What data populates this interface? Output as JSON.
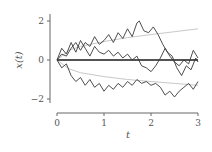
{
  "chart_data": {
    "type": "line",
    "title": "",
    "xlabel": "t",
    "ylabel": "x(t)",
    "xlim": [
      0,
      3
    ],
    "ylim": [
      -2.5,
      2.5
    ],
    "xticks": [
      0,
      1,
      2,
      3
    ],
    "xtick_labels": [
      "0",
      "1",
      "2",
      "3"
    ],
    "yticks": [
      -2,
      0,
      2
    ],
    "ytick_labels": [
      "−2",
      "0",
      "2"
    ],
    "grid": false,
    "legend": null,
    "series": [
      {
        "name": "mean",
        "style": "thick black",
        "x": [
          0,
          3
        ],
        "values": [
          0,
          0
        ]
      },
      {
        "name": "upper envelope",
        "style": "light gray smooth",
        "x": [
          0,
          0.25,
          0.5,
          1,
          1.5,
          2,
          2.5,
          3
        ],
        "values": [
          0,
          0.5,
          0.7,
          0.95,
          1.15,
          1.3,
          1.45,
          1.6
        ]
      },
      {
        "name": "lower envelope",
        "style": "light gray smooth",
        "x": [
          0,
          0.25,
          0.5,
          1,
          1.5,
          2,
          2.5,
          3
        ],
        "values": [
          0,
          -0.45,
          -0.65,
          -0.85,
          -1.0,
          -1.1,
          -1.2,
          -1.3
        ]
      },
      {
        "name": "path 1",
        "style": "dark gray jagged",
        "x": [
          0,
          0.1,
          0.2,
          0.3,
          0.4,
          0.5,
          0.6,
          0.7,
          0.8,
          0.9,
          1.0,
          1.1,
          1.2,
          1.3,
          1.4,
          1.5,
          1.6,
          1.7,
          1.75,
          1.85,
          1.95,
          2.05,
          2.15,
          2.25,
          2.35,
          2.45,
          2.55,
          2.65,
          2.75,
          2.85,
          2.95,
          3.0
        ],
        "values": [
          0,
          0.3,
          0.2,
          0.6,
          0.9,
          0.5,
          0.9,
          0.7,
          1.2,
          0.8,
          1.0,
          1.3,
          0.9,
          1.4,
          1.1,
          1.6,
          1.2,
          1.9,
          2.0,
          1.5,
          1.4,
          1.7,
          1.3,
          0.8,
          0.4,
          0.2,
          -0.4,
          -0.8,
          -0.3,
          -0.5,
          0.1,
          -0.1
        ]
      },
      {
        "name": "path 2",
        "style": "dark gray jagged",
        "x": [
          0,
          0.1,
          0.2,
          0.3,
          0.4,
          0.5,
          0.6,
          0.7,
          0.8,
          0.9,
          1.0,
          1.1,
          1.2,
          1.3,
          1.4,
          1.5,
          1.6,
          1.7,
          1.8,
          1.9,
          2.0,
          2.1,
          2.2,
          2.3,
          2.4,
          2.5,
          2.6,
          2.7,
          2.8,
          2.9,
          3.0
        ],
        "values": [
          0,
          0.6,
          0.3,
          0.9,
          0.4,
          1.0,
          0.6,
          0.2,
          0.7,
          0.4,
          0.3,
          0.5,
          0.2,
          0.4,
          0.1,
          0.3,
          0.0,
          0.2,
          -0.3,
          -0.4,
          -0.6,
          -0.3,
          0.1,
          0.6,
          0.2,
          -0.1,
          -0.3,
          0.0,
          -0.2,
          0.5,
          0.1
        ]
      },
      {
        "name": "path 3",
        "style": "dark gray jagged",
        "x": [
          0,
          0.1,
          0.2,
          0.3,
          0.4,
          0.5,
          0.6,
          0.7,
          0.8,
          0.9,
          1.0,
          1.1,
          1.2,
          1.3,
          1.4,
          1.5,
          1.6,
          1.7,
          1.8,
          1.9,
          2.0,
          2.1,
          2.2,
          2.3,
          2.4,
          2.5,
          2.6,
          2.7,
          2.8,
          2.9,
          3.0
        ],
        "values": [
          0,
          -0.4,
          -0.2,
          -0.8,
          -1.1,
          -0.9,
          -1.3,
          -1.0,
          -1.4,
          -1.2,
          -1.6,
          -1.3,
          -1.5,
          -1.2,
          -1.4,
          -1.1,
          -1.3,
          -1.0,
          -1.2,
          -1.1,
          -1.3,
          -1.2,
          -1.4,
          -1.8,
          -1.6,
          -1.9,
          -1.6,
          -1.4,
          -1.2,
          -1.5,
          -1.1
        ]
      }
    ]
  },
  "axes": {
    "xlabel": "t",
    "ylabel": "x(t)",
    "xtick_labels": [
      "0",
      "1",
      "2",
      "3"
    ],
    "ytick_labels": [
      "−2",
      "0",
      "2"
    ]
  }
}
